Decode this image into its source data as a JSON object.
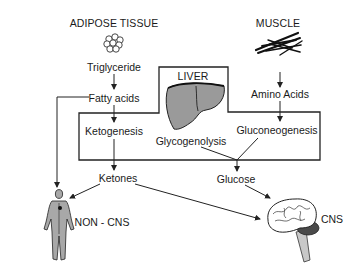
{
  "diagram": {
    "sources": {
      "adipose": {
        "label": "ADIPOSE TISSUE",
        "icon": "fat-cell-cluster-icon"
      },
      "muscle": {
        "label": "MUSCLE",
        "icon": "muscle-fibers-icon"
      },
      "liver": {
        "label": "LIVER",
        "icon": "liver-icon"
      }
    },
    "nodes": {
      "triglyceride": "Triglyceride",
      "fatty_acids": "Fatty acids",
      "ketogenesis": "Ketogenesis",
      "ketones": "Ketones",
      "amino_acids": "Amino Acids",
      "gluconeogenesis": "Gluconeogenesis",
      "glycogenolysis": "Glycogenolysis",
      "glucose": "Glucose"
    },
    "targets": {
      "non_cns": {
        "label": "NON - CNS",
        "icon": "human-body-icon"
      },
      "cns": {
        "label": "CNS",
        "icon": "brain-icon"
      }
    },
    "edges": [
      {
        "from": "Triglyceride",
        "to": "Fatty acids"
      },
      {
        "from": "Fatty acids",
        "to": "Ketogenesis"
      },
      {
        "from": "Fatty acids",
        "to": "NON-CNS"
      },
      {
        "from": "Ketogenesis",
        "to": "Ketones"
      },
      {
        "from": "Ketones",
        "to": "NON-CNS"
      },
      {
        "from": "Ketones",
        "to": "CNS"
      },
      {
        "from": "Amino Acids",
        "to": "Gluconeogenesis"
      },
      {
        "from": "Gluconeogenesis",
        "to": "Glucose"
      },
      {
        "from": "Glycogenolysis",
        "to": "Glucose"
      },
      {
        "from": "Glucose",
        "to": "CNS"
      }
    ],
    "colors": {
      "line": "#222222",
      "organ_fill": "#9a9a9a",
      "background": "#ffffff"
    }
  }
}
